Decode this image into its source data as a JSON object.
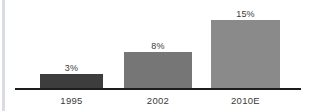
{
  "chart_data": {
    "type": "bar",
    "title": "",
    "subtitle": "",
    "xlabel": "",
    "ylabel": "",
    "categories": [
      "1995",
      "2002",
      "2010E"
    ],
    "values": [
      3,
      8,
      15
    ],
    "value_labels": [
      "3%",
      "8%",
      "15%"
    ],
    "units": "percent",
    "ylim": [
      0,
      15
    ],
    "grid": false,
    "legend": null,
    "bar_colors": [
      "#3d3d3d",
      "#767676",
      "#8a8a8a"
    ],
    "axis_color": "#1c1c1c",
    "background": "#ffffff",
    "annotations": []
  },
  "figure": {
    "left_rule_color": "#d9dce0"
  }
}
